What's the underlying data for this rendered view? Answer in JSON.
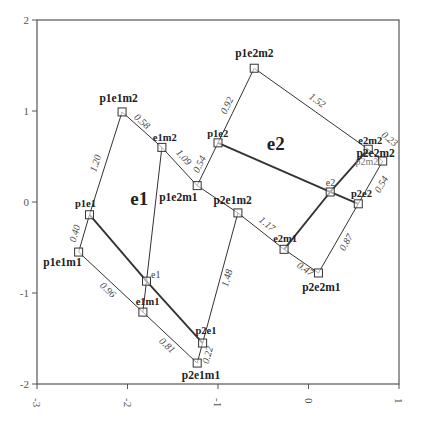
{
  "chart_data": {
    "type": "scatter",
    "title": "",
    "xlabel": "",
    "ylabel": "",
    "xlim": [
      -3,
      1
    ],
    "ylim": [
      -2,
      2
    ],
    "xticks": [
      "-3",
      "-2",
      "-1",
      "0",
      "1"
    ],
    "yticks": [
      "2",
      "1",
      "0",
      "-1",
      "-2"
    ],
    "grid": false,
    "legend": null,
    "region_labels": [
      {
        "text": "e1",
        "x": -1.97,
        "y": -0.03
      },
      {
        "text": "e2",
        "x": -0.46,
        "y": 0.57
      }
    ],
    "points": [
      {
        "id": "p1e1m2",
        "label": "p1e1m2",
        "x": -2.06,
        "y": 0.99,
        "style": "bold",
        "lx": -2.31,
        "ly": 1.1
      },
      {
        "id": "e1m2",
        "label": "e1m2",
        "x": -1.62,
        "y": 0.6,
        "style": "small-bold",
        "lx": -1.72,
        "ly": 0.67
      },
      {
        "id": "p1e1",
        "label": "p1e1",
        "x": -2.42,
        "y": -0.14,
        "style": "small-bold",
        "lx": -2.58,
        "ly": -0.05
      },
      {
        "id": "p1e1m1",
        "label": "p1e1m1",
        "x": -2.54,
        "y": -0.55,
        "style": "bold",
        "lx": -2.93,
        "ly": -0.7
      },
      {
        "id": "e1",
        "label": "e1",
        "x": -1.79,
        "y": -0.87,
        "style": "small",
        "lx": -1.74,
        "ly": -0.83
      },
      {
        "id": "e1m1",
        "label": "e1m1",
        "x": -1.83,
        "y": -1.21,
        "style": "small-bold",
        "lx": -1.91,
        "ly": -1.13
      },
      {
        "id": "p2e1",
        "label": "p2e1",
        "x": -1.17,
        "y": -1.55,
        "style": "small-bold",
        "lx": -1.25,
        "ly": -1.45
      },
      {
        "id": "p2e1m1",
        "label": "p2e1m1",
        "x": -1.23,
        "y": -1.77,
        "style": "bold",
        "lx": -1.4,
        "ly": -1.95
      },
      {
        "id": "p1e2m1",
        "label": "p1e2m1",
        "x": -1.23,
        "y": 0.18,
        "style": "bold",
        "lx": -1.65,
        "ly": 0.01
      },
      {
        "id": "p2e1m2",
        "label": "p2e1m2",
        "x": -0.78,
        "y": -0.12,
        "style": "bold",
        "lx": -1.05,
        "ly": -0.02
      },
      {
        "id": "p1e2",
        "label": "p1e2",
        "x": -1.0,
        "y": 0.65,
        "style": "small-bold",
        "lx": -1.12,
        "ly": 0.71
      },
      {
        "id": "p1e2m2",
        "label": "p1e2m2",
        "x": -0.6,
        "y": 1.47,
        "style": "bold",
        "lx": -0.81,
        "ly": 1.59
      },
      {
        "id": "e2",
        "label": "e2",
        "x": 0.24,
        "y": 0.11,
        "style": "small",
        "lx": 0.19,
        "ly": 0.18
      },
      {
        "id": "p2e2",
        "label": "p2e2",
        "x": 0.55,
        "y": -0.02,
        "style": "small-bold",
        "lx": 0.47,
        "ly": 0.06
      },
      {
        "id": "e2m1",
        "label": "e2m1",
        "x": -0.27,
        "y": -0.52,
        "style": "small-bold",
        "lx": -0.39,
        "ly": -0.44
      },
      {
        "id": "p2e2m1",
        "label": "p2e2m1",
        "x": 0.11,
        "y": -0.78,
        "style": "bold",
        "lx": -0.07,
        "ly": -0.98
      },
      {
        "id": "e2m2",
        "label": "e2m2",
        "x": 0.66,
        "y": 0.58,
        "style": "small-bold",
        "lx": 0.55,
        "ly": 0.64
      },
      {
        "id": "p2e2m2",
        "label": "p2e2m2",
        "x": 0.82,
        "y": 0.45,
        "style": "bold",
        "lx": 0.53,
        "ly": 0.5
      },
      {
        "id": "p2m2",
        "label": "p2m2",
        "x": 0.82,
        "y": 0.45,
        "style": "faint",
        "lx": 0.52,
        "ly": 0.41
      }
    ],
    "edges": [
      {
        "from": "p1e1m2",
        "to": "p1e1",
        "label": "1.20",
        "thick": false
      },
      {
        "from": "p1e1m2",
        "to": "e1m2",
        "label": "0.58",
        "thick": false
      },
      {
        "from": "e1m2",
        "to": "p1e2m1",
        "label": "1.09",
        "thick": false
      },
      {
        "from": "e1m2",
        "to": "e1",
        "label": "",
        "thick": false
      },
      {
        "from": "e1",
        "to": "e1m1",
        "label": "",
        "thick": false
      },
      {
        "from": "p1e1",
        "to": "p1e1m1",
        "label": "0.40",
        "thick": false
      },
      {
        "from": "p1e1",
        "to": "e1",
        "label": "",
        "thick": true
      },
      {
        "from": "e1",
        "to": "p2e1",
        "label": "",
        "thick": true
      },
      {
        "from": "p1e1m1",
        "to": "e1m1",
        "label": "0.96",
        "thick": false
      },
      {
        "from": "e1m1",
        "to": "p2e1m1",
        "label": "0.81",
        "thick": false
      },
      {
        "from": "p2e1m1",
        "to": "p2e1",
        "label": "0.22",
        "thick": false
      },
      {
        "from": "p2e1",
        "to": "p2e1m2",
        "label": "1.48",
        "thick": false
      },
      {
        "from": "p1e2m1",
        "to": "p2e1m2",
        "label": "",
        "thick": false
      },
      {
        "from": "p2e1m2",
        "to": "e2m1",
        "label": "1.17",
        "thick": false
      },
      {
        "from": "p1e2m1",
        "to": "p1e2",
        "label": "0.54",
        "thick": false
      },
      {
        "from": "p1e2",
        "to": "p1e2m2",
        "label": "0.92",
        "thick": false
      },
      {
        "from": "p1e2m2",
        "to": "e2m2",
        "label": "1.52",
        "thick": false
      },
      {
        "from": "e2m2",
        "to": "p2e2m2",
        "label": "0.23",
        "thick": false
      },
      {
        "from": "p1e2",
        "to": "e2",
        "label": "",
        "thick": true
      },
      {
        "from": "e2",
        "to": "p2e2",
        "label": "",
        "thick": true
      },
      {
        "from": "e2m1",
        "to": "e2",
        "label": "",
        "thick": true
      },
      {
        "from": "e2",
        "to": "e2m2",
        "label": "",
        "thick": true
      },
      {
        "from": "p2e2m2",
        "to": "p2e2",
        "label": "0.54",
        "thick": false
      },
      {
        "from": "e2m1",
        "to": "p2e2m1",
        "label": "0.47",
        "thick": false
      },
      {
        "from": "p2e2m1",
        "to": "p2e2",
        "label": "0.87",
        "thick": false
      }
    ],
    "edge_label_offsets": {
      "1.20": [
        -10,
        0
      ],
      "0.58": [
        0,
        -8
      ],
      "1.09": [
        4,
        -9
      ],
      "0.40": [
        -9,
        0
      ],
      "0.96": [
        -3,
        8
      ],
      "0.81": [
        -3,
        8
      ],
      "0.22": [
        8,
        2
      ],
      "1.48": [
        7,
        0
      ],
      "1.17": [
        6,
        -7
      ],
      "0.54a": [
        -8,
        0
      ],
      "0.92": [
        -9,
        0
      ],
      "1.52": [
        6,
        -8
      ],
      "0.23": [
        14,
        -16
      ],
      "0.47": [
        4,
        8
      ],
      "0.87": [
        8,
        4
      ],
      "0.54b": [
        11,
        2
      ]
    },
    "colors": {
      "axis": "#555555",
      "line": "#333333",
      "marker": "#333333",
      "background": "#ffffff"
    }
  }
}
